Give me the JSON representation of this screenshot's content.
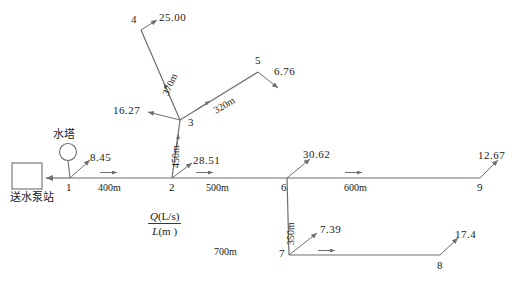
{
  "diagram": {
    "title_legend": {
      "numerator": "Q(L/s)",
      "denominator": "L(m)",
      "numerator_symbol": "Q",
      "numerator_unit": "(L/s)",
      "denominator_symbol": "L",
      "denominator_unit": "(m )"
    },
    "facilities": [
      {
        "id": "pump-station",
        "label": "送水泵站",
        "shape": "rectangle"
      },
      {
        "id": "water-tower",
        "label": "水塔",
        "shape": "circle"
      }
    ],
    "nodes": [
      {
        "id": "1",
        "label": "1"
      },
      {
        "id": "2",
        "label": "2"
      },
      {
        "id": "3",
        "label": "3"
      },
      {
        "id": "4",
        "label": "4"
      },
      {
        "id": "5",
        "label": "5"
      },
      {
        "id": "6",
        "label": "6"
      },
      {
        "id": "7",
        "label": "7"
      },
      {
        "id": "8",
        "label": "8"
      },
      {
        "id": "9",
        "label": "9"
      }
    ],
    "pipes": [
      {
        "from": "1",
        "to": "2",
        "length": "400m"
      },
      {
        "from": "2",
        "to": "6",
        "length": "500m"
      },
      {
        "from": "6",
        "to": "9",
        "length": "600m"
      },
      {
        "from": "2",
        "to": "3",
        "length": "450m"
      },
      {
        "from": "3",
        "to": "4",
        "length": "370m"
      },
      {
        "from": "3",
        "to": "5",
        "length": "320m"
      },
      {
        "from": "6",
        "to": "7",
        "length": "350m"
      },
      {
        "from": "7",
        "to": "8",
        "length": "700m"
      }
    ],
    "demands": [
      {
        "node": "1",
        "value": "8.45"
      },
      {
        "node": "2",
        "value": "28.51"
      },
      {
        "node": "3",
        "value": "16.27"
      },
      {
        "node": "4",
        "value": "25.00"
      },
      {
        "node": "5",
        "value": "6.76"
      },
      {
        "node": "6",
        "value": "30.62"
      },
      {
        "node": "7",
        "value": "7.39"
      },
      {
        "node": "8",
        "value": "17.4"
      },
      {
        "node": "9",
        "value": "12.67"
      }
    ],
    "colors": {
      "line": "#6e6e6e",
      "text": "#1a1a1a",
      "background": "#ffffff"
    }
  }
}
